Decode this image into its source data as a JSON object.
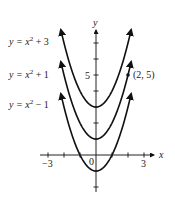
{
  "chart_data": {
    "type": "line",
    "title": "",
    "xlabel": "x",
    "ylabel": "y",
    "xlim": [
      -3.5,
      3.8
    ],
    "ylim": [
      -2,
      8
    ],
    "grid": false,
    "x_ticks": [
      -3,
      -2,
      -1,
      0,
      1,
      2,
      3
    ],
    "x_tick_labels": [
      "-3",
      "0",
      "3"
    ],
    "y_ticks": [
      -2,
      -1,
      1,
      2,
      3,
      4,
      5,
      6,
      7
    ],
    "y_tick_labels": [
      "5"
    ],
    "series": [
      {
        "name": "y = x² + 3",
        "formula": "x^2 + 3",
        "x_range": [
          -2.2,
          2.2
        ],
        "vertex": [
          0,
          3
        ]
      },
      {
        "name": "y = x² + 1",
        "formula": "x^2 + 1",
        "x_range": [
          -2.2,
          2.2
        ],
        "vertex": [
          0,
          1
        ]
      },
      {
        "name": "y = x² − 1",
        "formula": "x^2 - 1",
        "x_range": [
          -2.2,
          2.2
        ],
        "vertex": [
          0,
          -1
        ]
      }
    ],
    "annotations": [
      {
        "text": "(2, 5)",
        "point": [
          2,
          5
        ],
        "marker": "dot"
      }
    ],
    "legend_position": "left, inline labels"
  },
  "labels": {
    "curve1": {
      "pre": "y = x",
      "sup": "2",
      "post": " + 3"
    },
    "curve2": {
      "pre": "y = x",
      "sup": "2",
      "post": " + 1"
    },
    "curve3": {
      "pre": "y = x",
      "sup": "2",
      "post": " − 1"
    },
    "point": "(2, 5)",
    "x_axis": "x",
    "y_axis": "y",
    "tick_x_neg3": "−3",
    "tick_x_0": "0",
    "tick_x_3": "3",
    "tick_y_5": "5"
  }
}
